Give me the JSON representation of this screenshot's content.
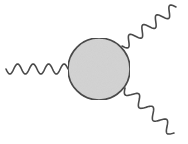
{
  "diagram": {
    "type": "feynman-vertex",
    "colors": {
      "background": "#ffffff",
      "stroke": "#4a4a4a",
      "blob_fill": "#d4d4d4"
    },
    "blob": {
      "cx": 99,
      "cy": 69,
      "r": 31
    },
    "lines": [
      {
        "name": "incoming-left",
        "x1": 6,
        "y1": 69,
        "x2": 68,
        "y2": 69,
        "periods": 4,
        "amplitude": 5
      },
      {
        "name": "outgoing-upper-right",
        "x1": 122,
        "y1": 46,
        "x2": 176,
        "y2": 7,
        "periods": 4,
        "amplitude": 5
      },
      {
        "name": "outgoing-lower-right",
        "x1": 125,
        "y1": 88,
        "x2": 174,
        "y2": 133,
        "periods": 3.5,
        "amplitude": 5
      }
    ]
  }
}
